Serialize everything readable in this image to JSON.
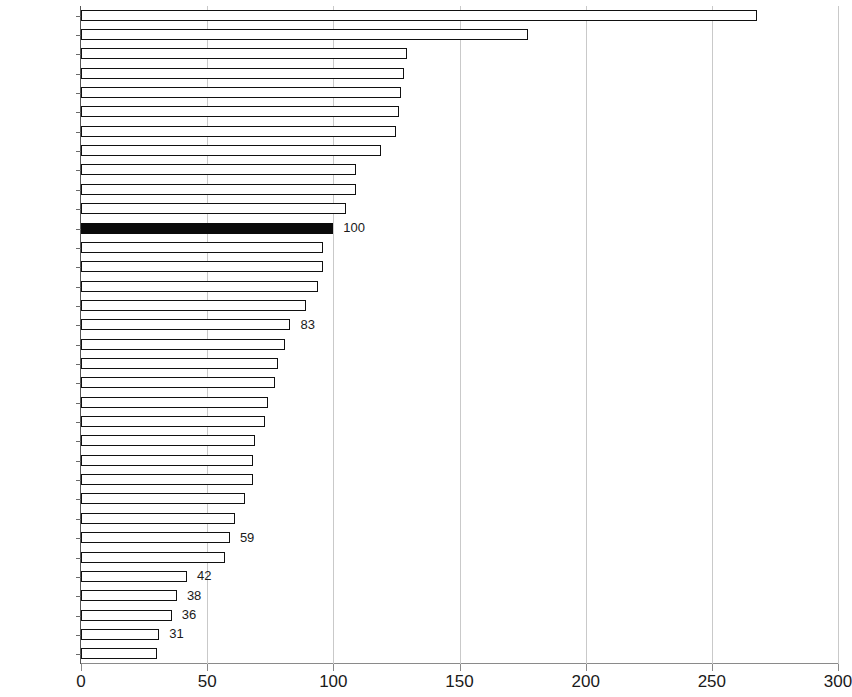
{
  "chart_data": {
    "type": "bar",
    "orientation": "horizontal",
    "title": "",
    "subtitle": "",
    "xlabel": "",
    "ylabel": "",
    "xlim": [
      0,
      300
    ],
    "xticks": [
      0,
      50,
      100,
      150,
      200,
      250,
      300
    ],
    "xtick_labels": [
      "0",
      "50",
      "100",
      "150",
      "200",
      "250",
      "300"
    ],
    "grid": "vertical",
    "legend": "none",
    "highlight_category": "EU28",
    "highlight_color": "#0a0a0a",
    "bar_color": "#ffffff",
    "bar_edge_color": "#111111",
    "categories": [
      "Luxemb",
      "Ireland",
      "Nether",
      "Austria",
      "Denmark",
      "Sweden",
      "Germany",
      "Belgium",
      "Finland",
      "UK",
      "France",
      "EU28",
      "Italy",
      "Malta",
      "Spain",
      "Czech R.",
      "Slovenia",
      "Cyprus",
      "Slovakia",
      "Portugal",
      "Lithuania",
      "Estonia",
      "Poland",
      "Hungary",
      "Greece",
      "Latvia",
      "Romania",
      "Croatia",
      "Bulgaria",
      "Montenegro",
      "Macedonia",
      "Serbia",
      "BiH",
      "Albania"
    ],
    "values": [
      268,
      177,
      129,
      128,
      127,
      126,
      125,
      119,
      109,
      109,
      105,
      100,
      96,
      96,
      94,
      89,
      83,
      81,
      78,
      77,
      74,
      73,
      69,
      68,
      68,
      65,
      61,
      59,
      57,
      42,
      38,
      36,
      31,
      30
    ],
    "data_labels": {
      "EU28": "100",
      "Slovenia": "83",
      "Croatia": "59",
      "Montenegro": "42",
      "Macedonia": "38",
      "Serbia": "36",
      "BiH": "31"
    }
  }
}
